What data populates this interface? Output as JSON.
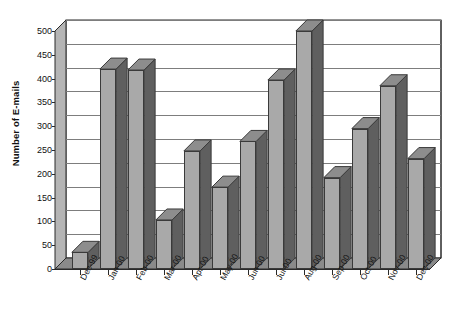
{
  "chart_data": {
    "type": "bar",
    "title": "",
    "xlabel": "",
    "ylabel": "Number of E-mails",
    "categories": [
      "Dec-99",
      "Jan-00",
      "Feb-00",
      "Mar-00",
      "Apr-00",
      "May-00",
      "Jun-00",
      "Jul-00",
      "Aug-00",
      "Sep-00",
      "Oct-00",
      "Nov-00",
      "Dec-00"
    ],
    "values": [
      35,
      420,
      418,
      103,
      248,
      172,
      268,
      397,
      500,
      192,
      295,
      385,
      232
    ],
    "ylim": [
      0,
      500
    ],
    "ytick_step": 50,
    "yticks": [
      0,
      50,
      100,
      150,
      200,
      250,
      300,
      350,
      400,
      450,
      500
    ],
    "grid": true,
    "legend": "none",
    "style": "3d-column",
    "colors": {
      "bar_front": "#a9a9a9",
      "bar_side": "#5f5f5f",
      "bar_top": "#8d8d8d",
      "gridline": "#7d7d7d",
      "axis": "#2a2a2a",
      "wall": "#b5b5b5",
      "floor": "#8a8a8a",
      "background": "#ffffff",
      "text": "#111111"
    }
  }
}
